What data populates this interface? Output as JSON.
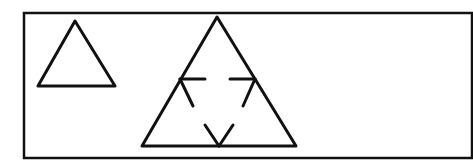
{
  "diagram": {
    "colors": {
      "stroke": "#111111",
      "background": "#ffffff"
    },
    "frame": {
      "x1": 24,
      "y1": 13,
      "x2": 472,
      "y2": 158
    },
    "shapes": [
      {
        "id": "small-triangle",
        "type": "triangle",
        "points": [
          [
            75,
            21
          ],
          [
            38,
            86
          ],
          [
            115,
            86
          ]
        ]
      },
      {
        "id": "large-triangle",
        "type": "triangle",
        "points": [
          [
            217,
            17
          ],
          [
            142,
            146
          ],
          [
            296,
            146
          ]
        ],
        "inner_marks": [
          {
            "id": "left-mark",
            "segments": [
              [
                [
                  180,
                  79
                ],
                [
                  205,
                  79
                ]
              ],
              [
                [
                  180,
                  79
                ],
                [
                  193,
                  106
                ]
              ]
            ]
          },
          {
            "id": "right-mark",
            "segments": [
              [
                [
                  230,
                  79
                ],
                [
                  255,
                  79
                ]
              ],
              [
                [
                  255,
                  79
                ],
                [
                  243,
                  106
                ]
              ]
            ]
          },
          {
            "id": "bottom-mark",
            "segments": [
              [
                [
                  205,
                  125
                ],
                [
                  219,
                  146
                ]
              ],
              [
                [
                  233,
                  125
                ],
                [
                  219,
                  146
                ]
              ]
            ]
          }
        ]
      }
    ]
  }
}
